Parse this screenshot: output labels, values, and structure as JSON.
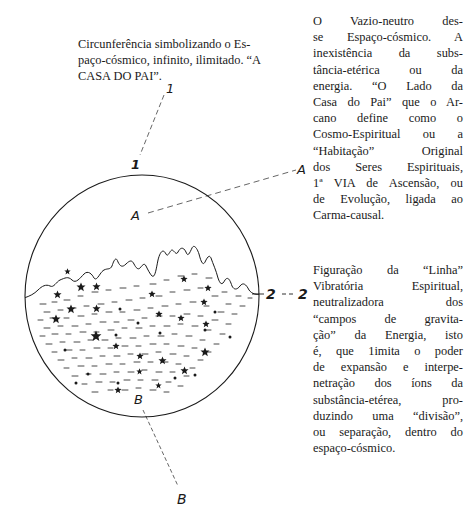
{
  "captions": {
    "top": {
      "lines": [
        "Circunferência simbolizando o Es-",
        "paço-cósmico, infinito, ilimitado. “A",
        "CASA DO PAI”."
      ]
    },
    "right_1": {
      "lines": [
        "O Vazio-neutro des-",
        "se Espaço-cósmico. A",
        "inexistência da subs-",
        "tância-etérica ou da",
        "energia. “O Lado da",
        "Casa do Pai” que o Ar-",
        "cano define como o",
        "Cosmo-Espiritual ou a",
        "“Habitação” Original",
        "dos Seres Espirituais,",
        "1ª VIA de Ascensão, ou",
        "de Evolução, ligada ao",
        "Carma-causal."
      ]
    },
    "right_2": {
      "lines": [
        "Figuração da “Linha”",
        "Vibratória Espiritual,",
        "neutralizadora dos",
        "“campos de gravita-",
        "ção” da Energia, isto",
        "é, que 1imita o poder",
        "de expansão e interpe-",
        "netração dos íons da",
        "substância-etérea, pro-",
        "duzindo uma “divisão”,",
        "ou separação, dentro do",
        "espaço-cósmico."
      ]
    }
  },
  "diagram": {
    "labels": {
      "one_outer": "1",
      "one_inner": "1",
      "a_inner": "A",
      "a_outer": "A",
      "two_inner": "2",
      "two_outer": "2",
      "b_inner": "B",
      "b_outer": "B"
    },
    "colors": {
      "ink": "#1a1a1a",
      "paper": "#ffffff"
    }
  }
}
